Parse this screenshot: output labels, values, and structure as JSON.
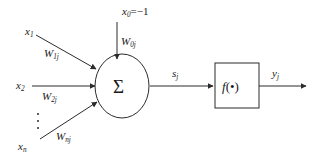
{
  "diagram": {
    "type": "neural-network-node",
    "background_color": "#ffffff",
    "stroke_color": "#2b2b2b",
    "text_color": "#1a1a1a",
    "bias_input": {
      "label_base": "x",
      "label_sub": "0",
      "label_value": "=−1",
      "weight_base": "W",
      "weight_sub": "0j"
    },
    "inputs": [
      {
        "label_base": "x",
        "label_sub": "1",
        "weight_base": "W",
        "weight_sub": "1j"
      },
      {
        "label_base": "x",
        "label_sub": "2",
        "weight_base": "W",
        "weight_sub": "2j"
      },
      {
        "label_base": "x",
        "label_sub": "n",
        "weight_base": "W",
        "weight_sub": "nj"
      }
    ],
    "ellipsis": "⋮",
    "summation": {
      "symbol": "Σ",
      "name": "summation-node"
    },
    "net_input": {
      "label_base": "s",
      "label_sub": "j"
    },
    "activation": {
      "fn_name": "f",
      "fn_arg": "(•)"
    },
    "output": {
      "label_base": "y",
      "label_sub": "j"
    }
  }
}
